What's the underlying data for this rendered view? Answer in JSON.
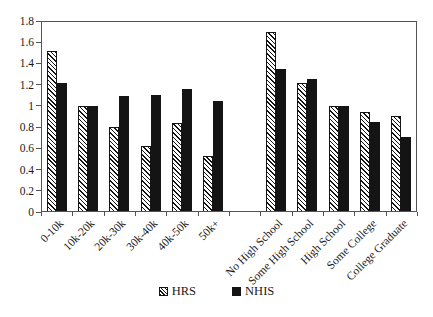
{
  "chart_data": {
    "type": "bar",
    "title": "",
    "xlabel": "",
    "ylabel": "",
    "categories": [
      "0-10k",
      "10k-20k",
      "20k-30k",
      "30k-40k",
      "40k-50k",
      "50k+",
      "No High School",
      "Some High School",
      "High School",
      "Some College",
      "College Graduate"
    ],
    "category_groups": [
      {
        "name": "income",
        "categories": [
          "0-10k",
          "10k-20k",
          "20k-30k",
          "30k-40k",
          "40k-50k",
          "50k+"
        ]
      },
      {
        "name": "education",
        "categories": [
          "No High School",
          "Some High School",
          "High School",
          "Some College",
          "College Graduate"
        ]
      }
    ],
    "gap_after_category": "50k+",
    "series": [
      {
        "name": "HRS",
        "fill": "hatch",
        "values": [
          1.52,
          1.0,
          0.8,
          0.62,
          0.84,
          0.53,
          1.7,
          1.22,
          1.0,
          0.94,
          0.9
        ]
      },
      {
        "name": "NHIS",
        "fill": "solid",
        "values": [
          1.22,
          1.0,
          1.09,
          1.1,
          1.16,
          1.05,
          1.35,
          1.25,
          1.0,
          0.85,
          0.71
        ]
      }
    ],
    "ylim": [
      0,
      1.8
    ],
    "ytick_step": 0.2,
    "ytick_labels": [
      "0",
      "0.2",
      "0.4",
      "0.6",
      "0.8",
      "1",
      "1.2",
      "1.4",
      "1.6",
      "1.8"
    ],
    "grid": false,
    "legend_position": "bottom",
    "x_label_rotation_deg": -45
  },
  "legend": {
    "items": [
      {
        "label": "HRS",
        "swatch": "hatch"
      },
      {
        "label": "NHIS",
        "swatch": "solid"
      }
    ]
  },
  "colors": {
    "bar_solid": "#141414",
    "bar_hatch_line": "#141414",
    "bar_hatch_bg": "#ffffff",
    "axis": "#545454",
    "text": "#1a1a1a",
    "background": "#ffffff"
  }
}
